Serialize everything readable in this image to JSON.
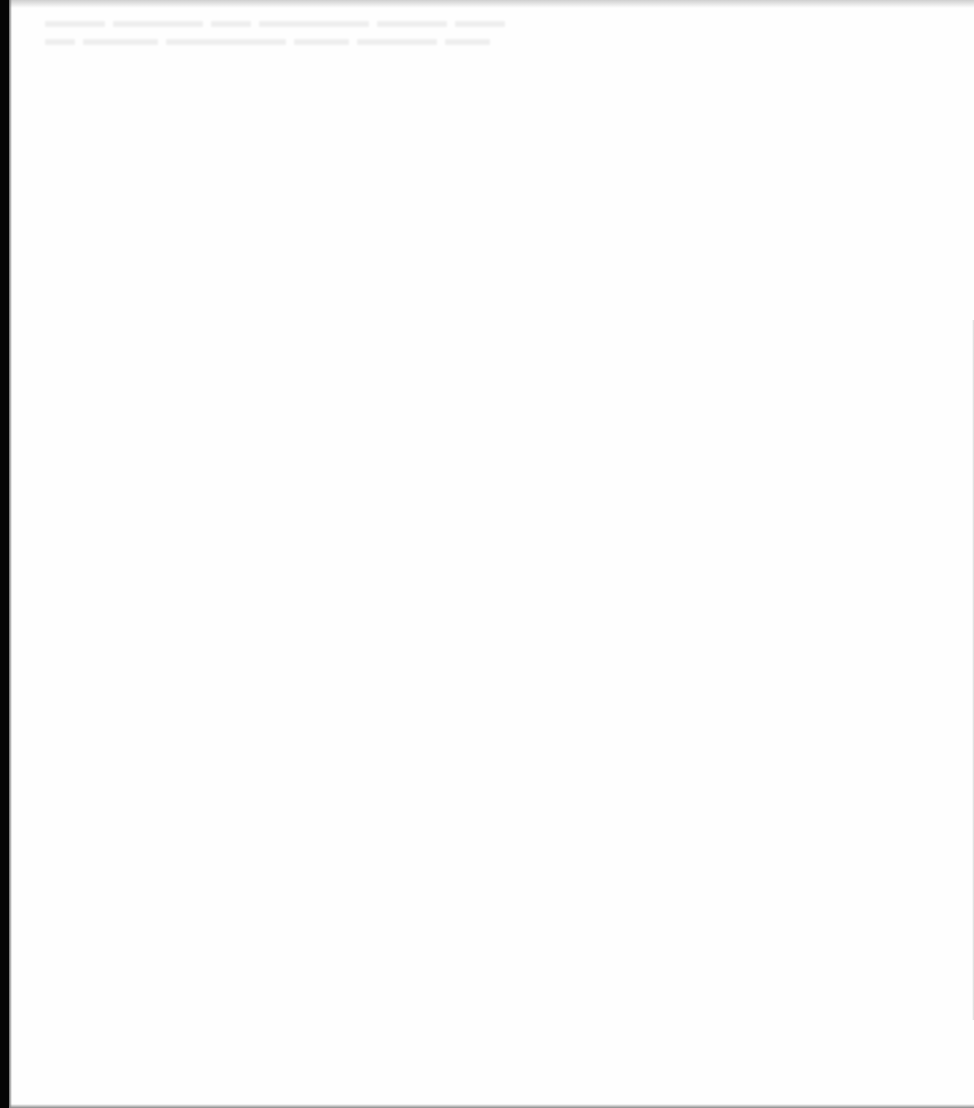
{
  "page": {
    "type": "scanned-blank-page",
    "background_color": "#fefefe",
    "binding_edge_color": "#050505",
    "bleed_through": {
      "legible": false,
      "lines": [
        {
          "segments": [
            60,
            90,
            40,
            110,
            70,
            50
          ]
        },
        {
          "segments": [
            30,
            75,
            120,
            55,
            80,
            45
          ]
        }
      ]
    }
  }
}
